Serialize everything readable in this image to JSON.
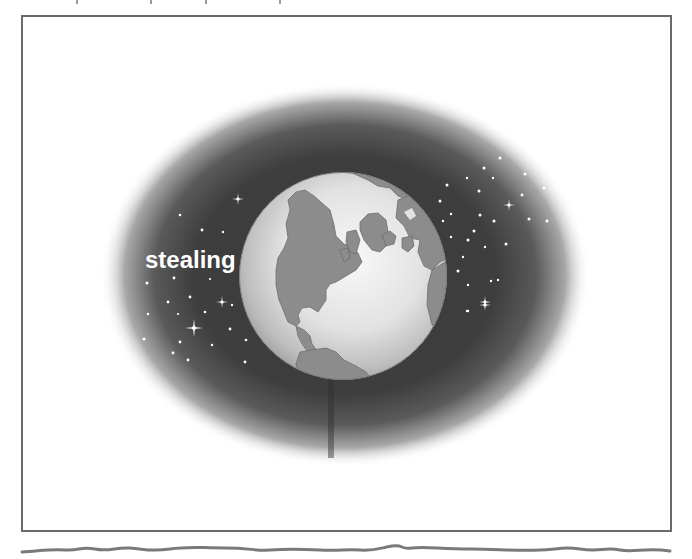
{
  "page": {
    "type": "worksheet-illustration",
    "frame_border_color": "#6a6a6a",
    "background_color": "#ffffff"
  },
  "illustration": {
    "subject": "Earth globe in space",
    "space_oval_color": "#3e3e3e",
    "globe_ocean_color": "#e4e4e4",
    "globe_land_color": "#8c8c8c",
    "star_color": "#ffffff",
    "label": {
      "text": "stealing",
      "color": "#ffffff"
    }
  },
  "answer_line": {
    "style": "wavy-handwriting-line",
    "color": "#7a7a7a"
  }
}
